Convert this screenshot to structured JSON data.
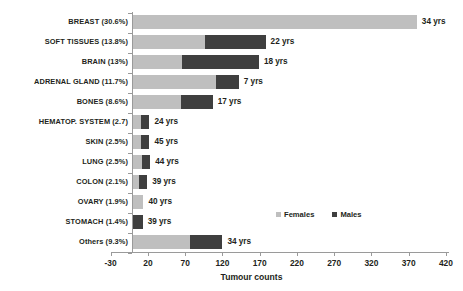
{
  "chart_data": {
    "type": "bar",
    "orientation": "horizontal",
    "stacked": true,
    "title": "",
    "xlabel": "Tumour counts",
    "ylabel": "",
    "xlim": [
      -30,
      420
    ],
    "xticks": [
      -30,
      20,
      70,
      120,
      170,
      220,
      270,
      320,
      370,
      420
    ],
    "grid": false,
    "legend_position": "inside-right",
    "categories": [
      "BREAST (30.6%)",
      "SOFT TISSUES (13.8%)",
      "BRAIN (13%)",
      "ADRENAL GLAND (11.7%)",
      "BONES (8.6%)",
      "HEMATOP. SYSTEM (2.7)",
      "SKIN (2.5%)",
      "LUNG (2.5%)",
      "COLON (2.1%)",
      "OVARY (1.9%)",
      "STOMACH (1.4%)",
      "Others (9.3%)"
    ],
    "series": [
      {
        "name": "Females",
        "color": "#bfbfbf",
        "values": [
          381,
          97,
          66,
          111,
          64,
          11,
          11,
          12,
          8,
          14,
          0,
          77
        ]
      },
      {
        "name": "Males",
        "color": "#3f3f3f",
        "values": [
          0,
          81,
          103,
          31,
          43,
          11,
          11,
          11,
          11,
          0,
          13,
          43
        ]
      }
    ],
    "annotations": [
      "34 yrs",
      "22 yrs",
      "18 yrs",
      "7 yrs",
      "17 yrs",
      "24 yrs",
      "45 yrs",
      "44 yrs",
      "39 yrs",
      "40 yrs",
      "39 yrs",
      "34 yrs"
    ]
  },
  "legend": {
    "items": [
      {
        "label": "Females",
        "color": "#bfbfbf"
      },
      {
        "label": "Males",
        "color": "#3f3f3f"
      }
    ]
  },
  "axis": {
    "x_title": "Tumour counts",
    "x_tick_labels": [
      "-30",
      "20",
      "70",
      "120",
      "170",
      "220",
      "270",
      "320",
      "370",
      "420"
    ]
  }
}
